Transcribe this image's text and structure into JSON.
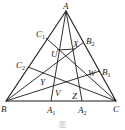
{
  "diagram": {
    "type": "triangle-cevians",
    "vertices": {
      "A": {
        "label": "A",
        "x": 66,
        "y": 11
      },
      "B": {
        "label": "B",
        "x": 6,
        "y": 101
      },
      "C": {
        "label": "C",
        "x": 116,
        "y": 101
      }
    },
    "side_points": {
      "A1": {
        "label": "A",
        "sub": "1",
        "x": 51,
        "y": 101,
        "on": "BC"
      },
      "A2": {
        "label": "A",
        "sub": "2",
        "x": 82,
        "y": 101,
        "on": "BC"
      },
      "B1": {
        "label": "B",
        "sub": "1",
        "x": 100,
        "y": 71,
        "on": "AC"
      },
      "B2": {
        "label": "B",
        "sub": "2",
        "x": 84,
        "y": 42,
        "on": "AC"
      },
      "C1": {
        "label": "C",
        "sub": "1",
        "x": 46,
        "y": 38,
        "on": "AB"
      },
      "C2": {
        "label": "C",
        "sub": "2",
        "x": 28,
        "y": 67,
        "on": "AB"
      }
    },
    "cevians": [
      {
        "from": "A",
        "to": "A1"
      },
      {
        "from": "A",
        "to": "A2"
      },
      {
        "from": "B",
        "to": "B1"
      },
      {
        "from": "B",
        "to": "B2"
      },
      {
        "from": "C",
        "to": "C1"
      },
      {
        "from": "C",
        "to": "C2"
      }
    ],
    "intersection_points": {
      "U": {
        "label": "U",
        "x": 57,
        "y": 53
      },
      "X": {
        "label": "X",
        "x": 75,
        "y": 47
      },
      "W": {
        "label": "W",
        "x": 90,
        "y": 70
      },
      "Y": {
        "label": "Y",
        "x": 43,
        "y": 80
      },
      "V": {
        "label": "V",
        "x": 57,
        "y": 89
      },
      "Z": {
        "label": "Z",
        "x": 75,
        "y": 92
      }
    },
    "caption": "图"
  }
}
